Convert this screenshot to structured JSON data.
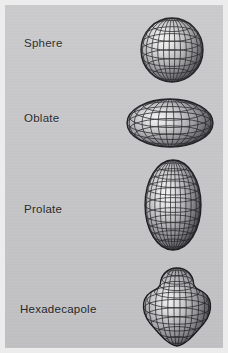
{
  "figure": {
    "width": 228,
    "height": 353,
    "background_color": "#ececed",
    "panel_color": "#c6c6c8",
    "label_color": "#232326",
    "wireframe_color": "#1b1b1f",
    "type": "nuclear-shape-illustration"
  },
  "rows": [
    {
      "label": "Sphere",
      "shape_name": "sphere-shape",
      "label_x": 24,
      "label_y": 39,
      "shape": {
        "x": 136,
        "y": 13,
        "w": 66,
        "h": 68,
        "cx": 33,
        "cy": 34,
        "rx": 31,
        "ry": 32,
        "meridians": 12,
        "parallels": 7,
        "highlight_x": 24,
        "highlight_y": 26,
        "profile": "circle"
      }
    },
    {
      "label": "Oblate",
      "shape_name": "oblate-shape",
      "label_x": 24,
      "label_y": 114,
      "shape": {
        "x": 122,
        "y": 92,
        "w": 90,
        "h": 56,
        "cx": 45,
        "cy": 27,
        "rx": 43,
        "ry": 24,
        "meridians": 12,
        "parallels": 7,
        "highlight_x": 34,
        "highlight_y": 21,
        "profile": "oblate"
      }
    },
    {
      "label": "Prolate",
      "shape_name": "prolate-shape",
      "label_x": 24,
      "label_y": 205,
      "shape": {
        "x": 139,
        "y": 155,
        "w": 62,
        "h": 94,
        "cx": 31,
        "cy": 47,
        "rx": 28,
        "ry": 45,
        "meridians": 12,
        "parallels": 9,
        "highlight_x": 22,
        "highlight_y": 38,
        "profile": "prolate"
      }
    },
    {
      "label": "Hexadecapole",
      "shape_name": "hexadecapole-shape",
      "label_x": 20,
      "label_y": 305,
      "shape": {
        "x": 137,
        "y": 261,
        "w": 72,
        "h": 84,
        "cx": 36,
        "cy": 42,
        "rx": 33,
        "ry": 41,
        "meridians": 12,
        "parallels": 9,
        "highlight_x": 27,
        "highlight_y": 36,
        "profile": "hexadecapole"
      }
    }
  ]
}
